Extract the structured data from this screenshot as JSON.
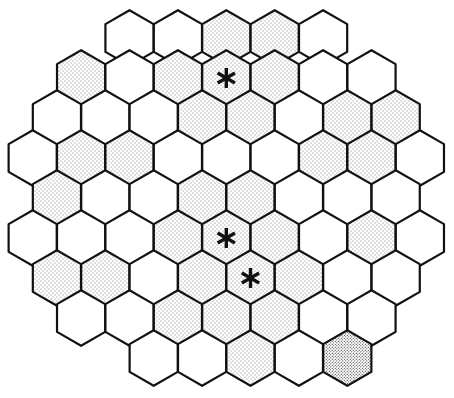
{
  "diagram": {
    "type": "hexagonal-grid",
    "orientation": "pointy-top",
    "legend": {
      "W": "unshaded cell",
      "S": "stippled (shaded) cell",
      "D": "darker stippled cell"
    },
    "colors": {
      "line": "#111111",
      "empty": "#ffffff",
      "shaded_dot": "#6f6f6f",
      "dark_dot": "#3a3a3a"
    },
    "rows": [
      {
        "start_col": 4,
        "cells": [
          "W",
          "W",
          "S",
          "S",
          "W"
        ]
      },
      {
        "start_col": 2,
        "cells": [
          "S",
          "W",
          "S",
          "S",
          "S",
          "W",
          "W"
        ]
      },
      {
        "start_col": 1,
        "cells": [
          "W",
          "W",
          "W",
          "S",
          "S",
          "W",
          "S",
          "S"
        ]
      },
      {
        "start_col": 0,
        "cells": [
          "W",
          "S",
          "S",
          "W",
          "W",
          "W",
          "S",
          "S",
          "W"
        ]
      },
      {
        "start_col": 1,
        "cells": [
          "S",
          "W",
          "W",
          "S",
          "S",
          "W",
          "W",
          "W"
        ]
      },
      {
        "start_col": 0,
        "cells": [
          "W",
          "W",
          "W",
          "S",
          "S",
          "S",
          "W",
          "S",
          "W"
        ]
      },
      {
        "start_col": 1,
        "cells": [
          "S",
          "S",
          "W",
          "S",
          "S",
          "S",
          "W",
          "W"
        ]
      },
      {
        "start_col": 2,
        "cells": [
          "W",
          "W",
          "S",
          "S",
          "S",
          "W",
          "W"
        ]
      },
      {
        "start_col": 5,
        "cells": [
          "W",
          "W",
          "S",
          "W",
          "D"
        ]
      }
    ],
    "markers": [
      {
        "row": 1,
        "index": 3,
        "symbol": "asterisk"
      },
      {
        "row": 5,
        "index": 4,
        "symbol": "asterisk"
      },
      {
        "row": 6,
        "index": 4,
        "symbol": "asterisk"
      }
    ]
  }
}
